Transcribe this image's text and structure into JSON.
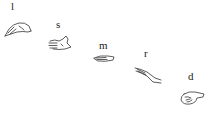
{
  "diagram": {
    "type": "hand-sign-sequence",
    "signs": [
      {
        "letter": "l",
        "icon": "hand-l-icon"
      },
      {
        "letter": "s",
        "icon": "hand-s-icon"
      },
      {
        "letter": "m",
        "icon": "hand-m-icon"
      },
      {
        "letter": "r",
        "icon": "hand-r-icon"
      },
      {
        "letter": "d",
        "icon": "hand-d-icon"
      }
    ],
    "stroke_color": "#333333",
    "background": "#ffffff"
  }
}
